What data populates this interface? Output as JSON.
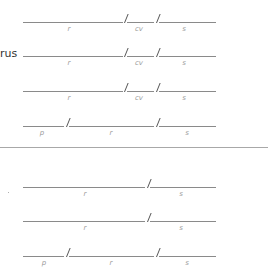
{
  "section_top": {
    "rows": [
      {
        "prefix": "",
        "labels": [
          "r",
          "cv",
          "s"
        ]
      },
      {
        "prefix": "rus",
        "labels": [
          "r",
          "cv",
          "s"
        ]
      },
      {
        "prefix": "",
        "labels": [
          "r",
          "cv",
          "s"
        ]
      },
      {
        "prefix": "",
        "labels": [
          "p",
          "r",
          "s"
        ]
      }
    ]
  },
  "section_bottom": {
    "rows": [
      {
        "prefix": ".",
        "labels": [
          "r",
          "s"
        ]
      },
      {
        "prefix": "",
        "labels": [
          "r",
          "s"
        ]
      },
      {
        "prefix": "",
        "labels": [
          "p",
          "r",
          "s"
        ]
      }
    ]
  },
  "colors": {
    "line": "#8a8a8a",
    "slash": "#555555",
    "label": "#9a9a9a",
    "text": "#333333",
    "divider": "#a8a8a8"
  }
}
